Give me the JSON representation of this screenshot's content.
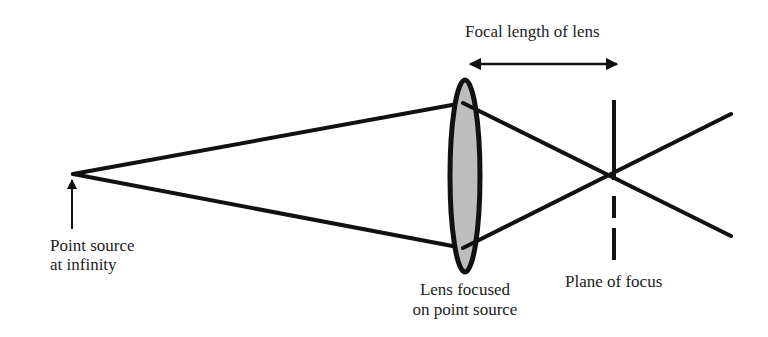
{
  "diagram": {
    "type": "optics-ray-diagram",
    "labels": {
      "focal_length": "Focal length of lens",
      "point_source_line1": "Point source",
      "point_source_line2": "at infinity",
      "lens_line1": "Lens focused",
      "lens_line2": "on point source",
      "plane_of_focus": "Plane of focus"
    },
    "colors": {
      "stroke": "#111111",
      "lens_fill": "#bdbdbd",
      "text": "#222222",
      "background": "#ffffff"
    }
  }
}
